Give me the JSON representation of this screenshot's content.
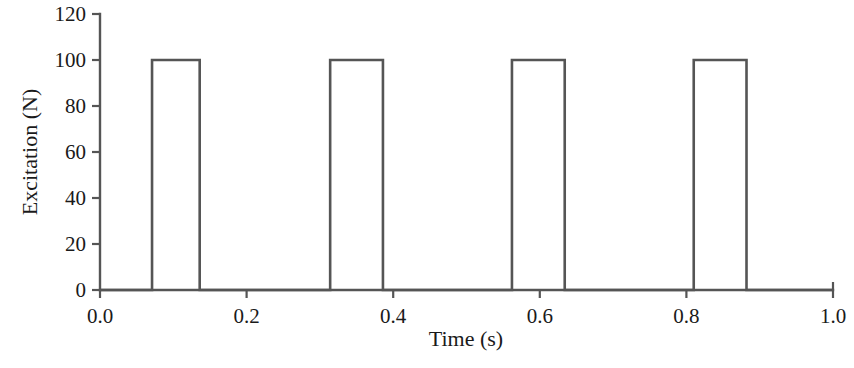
{
  "chart_data": {
    "type": "line",
    "title": "",
    "xlabel": "Time (s)",
    "ylabel": "Excitation (N)",
    "xlim": [
      0.0,
      1.0
    ],
    "ylim": [
      0,
      120
    ],
    "grid": false,
    "legend": null,
    "line_color": "#555555",
    "background_color": "#ffffff",
    "xticks": [
      0.0,
      0.2,
      0.4,
      0.6,
      0.8,
      1.0
    ],
    "xtick_labels": [
      "0.0",
      "0.2",
      "0.4",
      "0.6",
      "0.8",
      "1.0"
    ],
    "yticks": [
      0,
      20,
      40,
      60,
      80,
      100,
      120
    ],
    "ytick_labels": [
      "0",
      "20",
      "40",
      "60",
      "80",
      "100",
      "120"
    ],
    "series": [
      {
        "name": "Excitation pulse train",
        "waveform": "rectangular pulse train",
        "amplitude": 100,
        "baseline": 0,
        "pulse_count": 4,
        "pulse_width": 0.072,
        "period": 0.248,
        "pulses": [
          {
            "start": 0.071,
            "end": 0.136,
            "value": 100
          },
          {
            "start": 0.314,
            "end": 0.386,
            "value": 100
          },
          {
            "start": 0.562,
            "end": 0.634,
            "value": 100
          },
          {
            "start": 0.81,
            "end": 0.882,
            "value": 100
          }
        ],
        "x": [
          0.0,
          0.071,
          0.071,
          0.136,
          0.136,
          0.314,
          0.314,
          0.386,
          0.386,
          0.562,
          0.562,
          0.634,
          0.634,
          0.81,
          0.81,
          0.882,
          0.882,
          1.0
        ],
        "y": [
          0,
          0,
          100,
          100,
          0,
          0,
          100,
          100,
          0,
          0,
          100,
          100,
          0,
          0,
          100,
          100,
          0,
          0
        ]
      }
    ]
  },
  "caption": {
    "partial_text": ""
  }
}
